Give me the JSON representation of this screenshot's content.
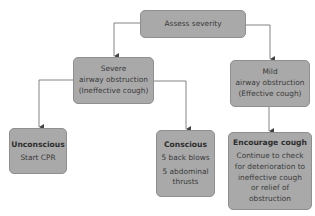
{
  "diagram": {
    "type": "flowchart",
    "colors": {
      "box_fill": "#a9a9a9",
      "box_border": "#8f8f8f",
      "line": "#555555",
      "text": "#3a3a3a"
    },
    "nodes": {
      "assess": {
        "lines": [
          "Assess severity"
        ]
      },
      "severe": {
        "lines": [
          "Severe",
          "airway obstruction",
          "(Ineffective cough)"
        ]
      },
      "mild": {
        "lines": [
          "Mild",
          "airway obstruction",
          "(Effective cough)"
        ]
      },
      "unconscious": {
        "title": "Unconscious",
        "lines": [
          "Start CPR"
        ]
      },
      "conscious": {
        "title": "Conscious",
        "lines": [
          "5 back blows",
          "5 abdominal",
          "thrusts"
        ]
      },
      "encourage": {
        "title": "Encourage cough",
        "lines": [
          "Continue to check",
          "for deterioration to",
          "ineffective cough",
          "or relief of",
          "obstruction"
        ]
      }
    },
    "edges": [
      {
        "from": "assess",
        "to": "severe"
      },
      {
        "from": "assess",
        "to": "mild"
      },
      {
        "from": "severe",
        "to": "unconscious"
      },
      {
        "from": "severe",
        "to": "conscious"
      },
      {
        "from": "mild",
        "to": "encourage"
      }
    ]
  }
}
